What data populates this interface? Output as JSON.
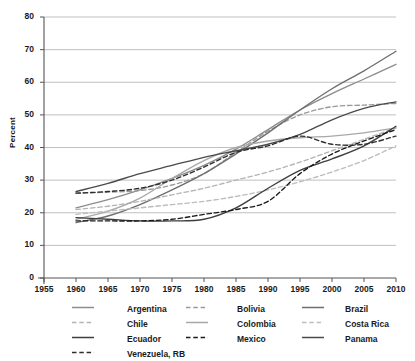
{
  "chart_data": {
    "type": "line",
    "title": "",
    "xlabel": "",
    "ylabel": "Percent",
    "xlim": [
      1955,
      2010
    ],
    "ylim": [
      0,
      80
    ],
    "xticks": [
      1955,
      1960,
      1965,
      1970,
      1975,
      1980,
      1985,
      1990,
      1995,
      2000,
      2005,
      2010
    ],
    "yticks": [
      0,
      10,
      20,
      30,
      40,
      50,
      60,
      70,
      80
    ],
    "grid": "horizontal",
    "legend_position": "bottom",
    "x": [
      1960,
      1965,
      1970,
      1975,
      1980,
      1985,
      1990,
      1995,
      2000,
      2005,
      2010
    ],
    "series": [
      {
        "name": "Argentina",
        "color": "#8c8c8c",
        "style": "solid",
        "values": [
          21.5,
          24.0,
          27.0,
          30.5,
          34.5,
          39.5,
          45.5,
          51.5,
          56.5,
          61.0,
          65.5
        ]
      },
      {
        "name": "Bolivia",
        "color": "#9a9a9a",
        "style": "dashed",
        "values": [
          26.0,
          26.3,
          26.8,
          28.5,
          32.0,
          38.5,
          45.0,
          50.0,
          52.5,
          53.0,
          53.5
        ]
      },
      {
        "name": "Brazil",
        "color": "#6e6e6e",
        "style": "solid",
        "values": [
          17.0,
          19.0,
          22.5,
          27.0,
          32.0,
          38.0,
          44.5,
          51.5,
          58.0,
          63.5,
          69.5
        ]
      },
      {
        "name": "Chile",
        "color": "#b4b4b4",
        "style": "dashed",
        "values": [
          21.0,
          22.0,
          23.5,
          25.5,
          27.5,
          30.0,
          32.5,
          35.5,
          39.0,
          42.5,
          46.0
        ]
      },
      {
        "name": "Colombia",
        "color": "#a8a8a8",
        "style": "solid",
        "values": [
          18.0,
          20.5,
          24.5,
          30.5,
          36.0,
          40.0,
          42.0,
          43.0,
          43.5,
          44.5,
          46.0
        ]
      },
      {
        "name": "Costa Rica",
        "color": "#bdbdbd",
        "style": "dashed",
        "values": [
          19.5,
          20.5,
          21.5,
          22.5,
          23.5,
          25.0,
          27.0,
          29.5,
          32.5,
          36.0,
          40.5
        ]
      },
      {
        "name": "Ecuador",
        "color": "#3d3d3d",
        "style": "solid",
        "values": [
          18.5,
          18.0,
          17.5,
          17.5,
          18.0,
          21.5,
          27.5,
          33.0,
          36.5,
          40.5,
          46.5
        ]
      },
      {
        "name": "Mexico",
        "color": "#1a1a1a",
        "style": "dashed",
        "values": [
          17.5,
          17.5,
          17.5,
          18.0,
          19.5,
          21.0,
          23.5,
          32.0,
          38.0,
          42.0,
          45.5
        ]
      },
      {
        "name": "Panama",
        "color": "#4a4a4a",
        "style": "solid",
        "values": [
          26.5,
          29.0,
          32.0,
          34.5,
          37.0,
          39.0,
          41.0,
          44.0,
          48.5,
          52.0,
          54.0
        ]
      },
      {
        "name": "Venezuela, RB",
        "color": "#2e2e2e",
        "style": "dashed",
        "values": [
          26.0,
          26.5,
          27.5,
          30.0,
          34.0,
          38.5,
          40.5,
          43.5,
          41.0,
          41.0,
          43.5
        ]
      }
    ]
  },
  "axis": {
    "ylabel": "Percent",
    "yticks": [
      "0",
      "10",
      "20",
      "30",
      "40",
      "50",
      "60",
      "70",
      "80"
    ],
    "xticks": [
      "1955",
      "1960",
      "1965",
      "1970",
      "1975",
      "1980",
      "1985",
      "1990",
      "1995",
      "2000",
      "2005",
      "2010"
    ]
  },
  "legend": {
    "items": [
      {
        "label": "Argentina",
        "color": "#8c8c8c",
        "style": "solid"
      },
      {
        "label": "Bolivia",
        "color": "#9a9a9a",
        "style": "dashed"
      },
      {
        "label": "Brazil",
        "color": "#6e6e6e",
        "style": "solid"
      },
      {
        "label": "Chile",
        "color": "#b4b4b4",
        "style": "dashed"
      },
      {
        "label": "Colombia",
        "color": "#a8a8a8",
        "style": "solid"
      },
      {
        "label": "Costa Rica",
        "color": "#bdbdbd",
        "style": "dashed"
      },
      {
        "label": "Ecuador",
        "color": "#3d3d3d",
        "style": "solid"
      },
      {
        "label": "Mexico",
        "color": "#1a1a1a",
        "style": "dashed"
      },
      {
        "label": "Panama",
        "color": "#4a4a4a",
        "style": "solid"
      },
      {
        "label": "Venezuela, RB",
        "color": "#2e2e2e",
        "style": "dashed"
      }
    ]
  },
  "colors": {
    "grid": "#b9b9b9",
    "axis": "#555555",
    "text": "#1a1a1a",
    "background": "#ffffff"
  }
}
